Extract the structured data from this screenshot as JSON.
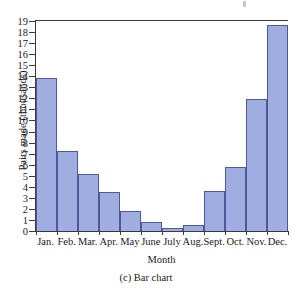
{
  "figure": {
    "caption": "(c) Bar chart",
    "background_color": "#ffffff"
  },
  "chart_data": {
    "type": "bar",
    "title": "",
    "xlabel": "Month",
    "ylabel": "Pairs made (thousands)",
    "categories": [
      "Jan.",
      "Feb.",
      "Mar.",
      "Apr.",
      "May",
      "June",
      "July",
      "Aug.",
      "Sept.",
      "Oct.",
      "Nov.",
      "Dec."
    ],
    "values": [
      13.8,
      7.25,
      5.2,
      3.5,
      1.8,
      0.8,
      0.3,
      0.5,
      3.65,
      5.8,
      11.9,
      18.6
    ],
    "ylim": [
      0,
      19
    ],
    "ytick_values": [
      0,
      1,
      2,
      3,
      4,
      5,
      6,
      7,
      8,
      9,
      10,
      11,
      12,
      13,
      14,
      15,
      16,
      17,
      18,
      19
    ],
    "ytick_labels": [
      "0",
      "1",
      "2",
      "3",
      "4",
      "5",
      "6",
      "7",
      "8",
      "9",
      "10",
      "11",
      "12",
      "13",
      "14",
      "15",
      "16",
      "17",
      "18",
      "19"
    ],
    "grid": false,
    "legend": null,
    "bar_fill_color": "#9fade1",
    "bar_edge_color": "#50589a",
    "axis_color": "#3a3a3a"
  }
}
